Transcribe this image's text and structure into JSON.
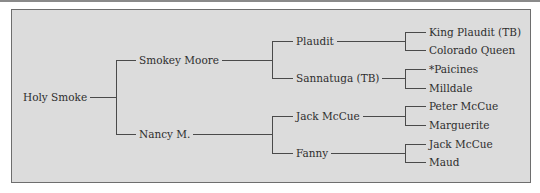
{
  "pedigree": {
    "subject": "Holy Smoke",
    "sire": "Smokey Moore",
    "dam": "Nancy M.",
    "sire_sire": "Plaudit",
    "sire_dam": "Sannatuga (TB)",
    "dam_sire": "Jack McCue",
    "dam_dam": "Fanny",
    "sire_sire_sire": "King Plaudit (TB)",
    "sire_sire_dam": "Colorado Queen",
    "sire_dam_sire": "*Paicines",
    "sire_dam_dam": "Milldale",
    "dam_sire_sire": "Peter McCue",
    "dam_sire_dam": "Marguerite",
    "dam_dam_sire": "Jack McCue",
    "dam_dam_dam": "Maud"
  },
  "colors": {
    "background": "#dcdcdc",
    "lines": "#4a4a4a",
    "border": "#6e6e6e"
  }
}
